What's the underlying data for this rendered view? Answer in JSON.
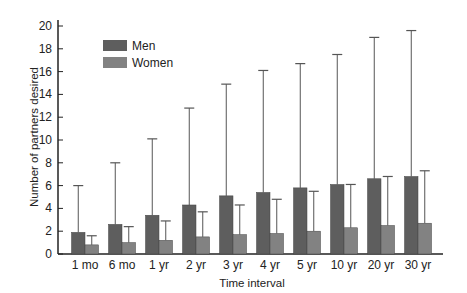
{
  "chart_data": {
    "type": "bar",
    "title": "",
    "xlabel": "Time interval",
    "ylabel": "Number of partners desired",
    "ylim": [
      0,
      20
    ],
    "yticks": [
      0,
      2,
      4,
      6,
      8,
      10,
      12,
      14,
      16,
      18,
      20
    ],
    "grid": false,
    "legend_position": "upper-left",
    "categories": [
      "1 mo",
      "6 mo",
      "1 yr",
      "2 yr",
      "3 yr",
      "4 yr",
      "5 yr",
      "10 yr",
      "20 yr",
      "30 yr"
    ],
    "series": [
      {
        "name": "Men",
        "color": "#5e5e5e",
        "values": [
          1.9,
          2.6,
          3.4,
          4.3,
          5.1,
          5.4,
          5.8,
          6.1,
          6.6,
          6.8
        ],
        "error_upper": [
          6.0,
          8.0,
          10.1,
          12.8,
          14.9,
          16.1,
          16.7,
          17.5,
          19.0,
          19.6
        ]
      },
      {
        "name": "Women",
        "color": "#828282",
        "values": [
          0.8,
          1.0,
          1.2,
          1.5,
          1.7,
          1.8,
          2.0,
          2.3,
          2.5,
          2.7
        ],
        "error_upper": [
          1.6,
          2.4,
          2.9,
          3.7,
          4.3,
          4.8,
          5.5,
          6.1,
          6.8,
          7.3
        ]
      }
    ]
  }
}
